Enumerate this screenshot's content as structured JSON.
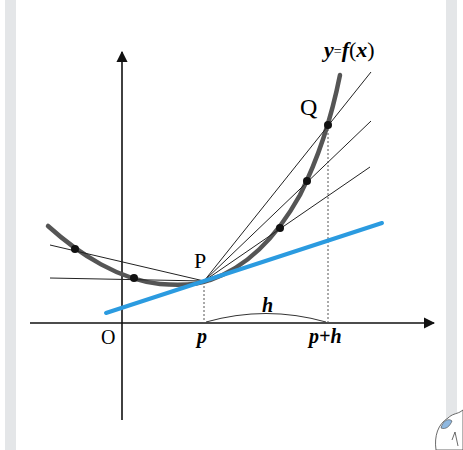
{
  "diagram": {
    "function_label": "y=f(x)",
    "function_label_parts": {
      "y": "y",
      "eq": "=",
      "f": "f",
      "lp": "(",
      "x": "x",
      "rp": ")"
    },
    "point_P": "P",
    "point_Q": "Q",
    "origin": "O",
    "x_tick_p": "p",
    "x_tick_p_plus_h": "p+h",
    "interval_label": "h",
    "colors": {
      "curve": "#555555",
      "axes": "#111111",
      "secant": "#222222",
      "tangent": "#2b9be0",
      "dots": "#111111",
      "border_strip": "#e4e6e8"
    }
  }
}
